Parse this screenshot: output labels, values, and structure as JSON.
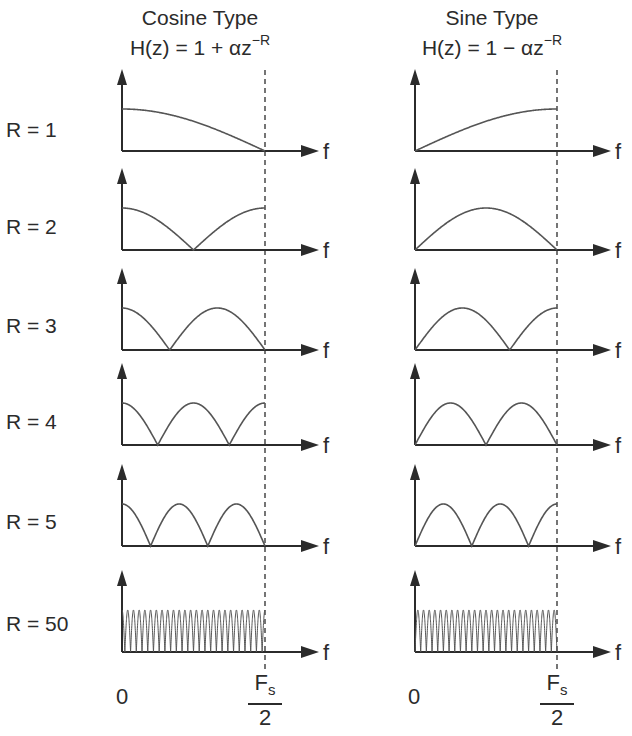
{
  "columns": [
    {
      "title": "Cosine Type",
      "formula_main": "H(z) = 1 + αz",
      "formula_exp": "−R"
    },
    {
      "title": "Sine Type",
      "formula_main": "H(z) = 1 − αz",
      "formula_exp": "−R"
    }
  ],
  "rows": [
    {
      "label": "R = 1"
    },
    {
      "label": "R = 2"
    },
    {
      "label": "R = 3"
    },
    {
      "label": "R = 4"
    },
    {
      "label": "R = 5"
    },
    {
      "label": "R = 50"
    }
  ],
  "axis": {
    "f_label": "f",
    "zero_label": "0",
    "fs_numerator": "F",
    "fs_sub": "s",
    "fs_denominator": "2"
  },
  "colors": {
    "ink": "#2b2b2b",
    "curve": "#555555",
    "background": "#ffffff"
  },
  "chart_data": {
    "type": "line",
    "xlabel": "f",
    "x_range": [
      "0",
      "Fs/2"
    ],
    "panels": [
      {
        "column": "Cosine Type",
        "formula": "H(z) = 1 + αz^-R",
        "response": "|cos(πRf/Fs)|",
        "R_values": [
          1,
          2,
          3,
          4,
          5,
          50
        ]
      },
      {
        "column": "Sine Type",
        "formula": "H(z) = 1 − αz^-R",
        "response": "|sin(πRf/Fs)|",
        "R_values": [
          1,
          2,
          3,
          4,
          5,
          50
        ]
      }
    ]
  }
}
